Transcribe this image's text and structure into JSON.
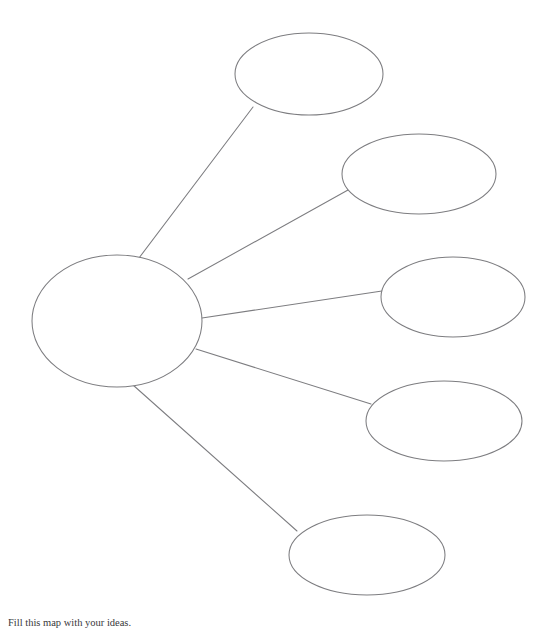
{
  "document": {
    "title": "Concept Web Diagram",
    "background_color": "#ffffff",
    "stroke_color": "#7d7d80",
    "fill_color": "#ffffff",
    "width": 553,
    "height": 628
  },
  "caption": {
    "text": "Fill this map with your ideas."
  },
  "diagram": {
    "type": "concept-web",
    "center_node": {
      "id": "center",
      "label": "",
      "cx": 117,
      "cy": 321,
      "rx": 85,
      "ry": 66
    },
    "branch_nodes": [
      {
        "id": "branch-1",
        "label": "",
        "cx": 309,
        "cy": 74,
        "rx": 74,
        "ry": 41
      },
      {
        "id": "branch-2",
        "label": "",
        "cx": 419,
        "cy": 174,
        "rx": 77,
        "ry": 40
      },
      {
        "id": "branch-3",
        "label": "",
        "cx": 453,
        "cy": 297,
        "rx": 72,
        "ry": 40
      },
      {
        "id": "branch-4",
        "label": "",
        "cx": 444,
        "cy": 421,
        "rx": 78,
        "ry": 40
      },
      {
        "id": "branch-5",
        "label": "",
        "cx": 367,
        "cy": 555,
        "rx": 78,
        "ry": 40
      }
    ],
    "connectors": [
      {
        "id": "connector-1",
        "from": "center",
        "to": "branch-1",
        "x1": 139,
        "y1": 258,
        "x2": 253,
        "y2": 107
      },
      {
        "id": "connector-2",
        "from": "center",
        "to": "branch-2",
        "x1": 188,
        "y1": 279,
        "x2": 348,
        "y2": 190
      },
      {
        "id": "connector-3",
        "from": "center",
        "to": "branch-3",
        "x1": 202,
        "y1": 318,
        "x2": 382,
        "y2": 291
      },
      {
        "id": "connector-4",
        "from": "center",
        "to": "branch-4",
        "x1": 196,
        "y1": 349,
        "x2": 371,
        "y2": 404
      },
      {
        "id": "connector-5",
        "from": "center",
        "to": "branch-5",
        "x1": 133,
        "y1": 385,
        "x2": 297,
        "y2": 531
      }
    ]
  }
}
